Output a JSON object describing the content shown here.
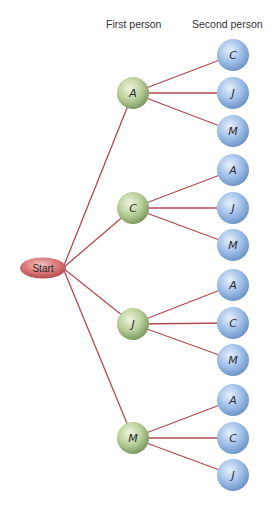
{
  "headers": {
    "first": "First person",
    "second": "Second person"
  },
  "start": {
    "label": "Start",
    "x": 43,
    "y": 268
  },
  "colors": {
    "edge": "#b24a4f",
    "start_fill": "#d56c6f",
    "first_fill": "#b9cf9a",
    "second_fill": "#9dbde6"
  },
  "tree": [
    {
      "label": "A",
      "x": 133,
      "y": 93,
      "children": [
        {
          "label": "C",
          "y": 55
        },
        {
          "label": "J",
          "y": 93
        },
        {
          "label": "M",
          "y": 131
        }
      ]
    },
    {
      "label": "C",
      "x": 133,
      "y": 208,
      "children": [
        {
          "label": "A",
          "y": 170
        },
        {
          "label": "J",
          "y": 208
        },
        {
          "label": "M",
          "y": 245
        }
      ]
    },
    {
      "label": "J",
      "x": 133,
      "y": 324,
      "children": [
        {
          "label": "A",
          "y": 285
        },
        {
          "label": "C",
          "y": 323
        },
        {
          "label": "M",
          "y": 360
        }
      ]
    },
    {
      "label": "M",
      "x": 133,
      "y": 438,
      "children": [
        {
          "label": "A",
          "y": 400
        },
        {
          "label": "C",
          "y": 438
        },
        {
          "label": "J",
          "y": 475
        }
      ]
    }
  ],
  "second_x": 233
}
